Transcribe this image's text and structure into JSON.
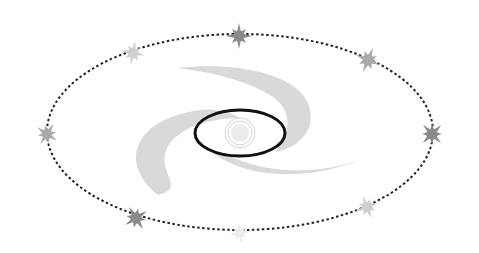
{
  "diagram": {
    "type": "orbit-illustration",
    "colors": {
      "background": "#ffffff",
      "galaxy_arms": "#d9d9d9",
      "inner_orbit": "#111111",
      "outer_orbit": "#222222",
      "star_dark": "#8a8a8a",
      "star_medium": "#a9a9a9",
      "star_light": "#cfcfcf",
      "star_faint": "#ececec"
    },
    "outer_orbit": {
      "cx": 240,
      "cy": 132,
      "rx": 193,
      "ry": 98,
      "style": "dotted"
    },
    "inner_orbit": {
      "cx": 240,
      "cy": 133,
      "rx": 45,
      "ry": 23,
      "style": "solid"
    },
    "center": {
      "cx": 240,
      "cy": 133
    },
    "stars": [
      {
        "x": 239,
        "y": 36,
        "shade": "star_dark",
        "r": 13
      },
      {
        "x": 133,
        "y": 53,
        "shade": "star_light",
        "r": 12
      },
      {
        "x": 368,
        "y": 60,
        "shade": "star_medium",
        "r": 13
      },
      {
        "x": 47,
        "y": 134,
        "shade": "star_medium",
        "r": 12
      },
      {
        "x": 432,
        "y": 134,
        "shade": "star_dark",
        "r": 13
      },
      {
        "x": 136,
        "y": 218,
        "shade": "star_dark",
        "r": 13
      },
      {
        "x": 367,
        "y": 207,
        "shade": "star_light",
        "r": 12
      },
      {
        "x": 240,
        "y": 233,
        "shade": "star_faint",
        "r": 11
      }
    ]
  }
}
